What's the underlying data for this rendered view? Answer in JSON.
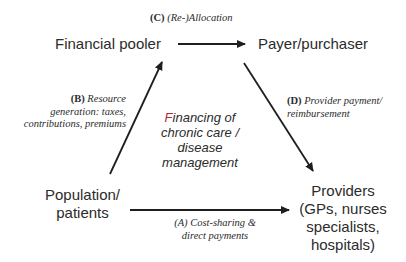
{
  "diagram": {
    "nodes": {
      "financial_pooler": "Financial pooler",
      "payer_purchaser": "Payer/purchaser",
      "population_line1": "Population/",
      "population_line2": "patients",
      "providers_line1": "Providers",
      "providers_line2": "(GPs, nurses",
      "providers_line3": "specialists,",
      "providers_line4": "hospitals)"
    },
    "center": {
      "line1_first_letter": "F",
      "line1_rest": "inancing of",
      "line2": "chronic care /",
      "line3": "disease",
      "line4": "management"
    },
    "edges": {
      "A": {
        "code": "(A)",
        "line1": "Cost-sharing &",
        "line2": "direct payments",
        "from": "Population/patients",
        "to": "Providers"
      },
      "B": {
        "code": "(B)",
        "line1": "Resource",
        "line2": "generation: taxes,",
        "line3": "contributions, premiums",
        "from": "Population/patients",
        "to": "Financial pooler"
      },
      "C": {
        "code": "(C)",
        "line1": "(Re-)Allocation",
        "from": "Financial pooler",
        "to": "Payer/purchaser"
      },
      "D": {
        "code": "(D)",
        "line1": "Provider payment/",
        "line2": "reimbursement",
        "from": "Payer/purchaser",
        "to": "Providers"
      }
    },
    "colors": {
      "text": "#2b2b2b",
      "arrow": "#1e1e1e",
      "accent": "#b0283a",
      "background": "#ffffff"
    }
  }
}
